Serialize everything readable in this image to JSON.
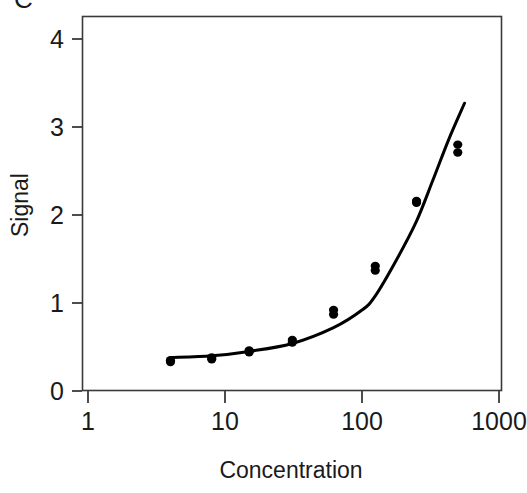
{
  "chart_data": {
    "type": "scatter",
    "title": "",
    "subtitle": "",
    "xlabel": "Concentration",
    "ylabel": "Signal",
    "xscale": "log",
    "yscale": "linear",
    "xlim": [
      1,
      1000
    ],
    "ylim": [
      0,
      4.25
    ],
    "grid": false,
    "legend": null,
    "x_tick_labels": [
      "1",
      "10",
      "100",
      "1000"
    ],
    "x_tick_values": [
      1,
      10,
      100,
      1000
    ],
    "y_tick_labels": [
      "0",
      "1",
      "2",
      "3",
      "4"
    ],
    "y_tick_values": [
      0,
      1,
      2,
      3,
      4
    ],
    "series": [
      {
        "name": "observed",
        "type": "scatter",
        "marker": "filled-circle",
        "color": "#000000",
        "points": [
          {
            "x": 4,
            "y": 0.35
          },
          {
            "x": 4,
            "y": 0.33
          },
          {
            "x": 8,
            "y": 0.38
          },
          {
            "x": 8,
            "y": 0.36
          },
          {
            "x": 15,
            "y": 0.46
          },
          {
            "x": 15,
            "y": 0.44
          },
          {
            "x": 31,
            "y": 0.58
          },
          {
            "x": 31,
            "y": 0.55
          },
          {
            "x": 62,
            "y": 0.92
          },
          {
            "x": 62,
            "y": 0.87
          },
          {
            "x": 125,
            "y": 1.42
          },
          {
            "x": 125,
            "y": 1.37
          },
          {
            "x": 250,
            "y": 2.16
          },
          {
            "x": 250,
            "y": 2.14
          },
          {
            "x": 500,
            "y": 2.8
          },
          {
            "x": 500,
            "y": 2.71
          }
        ]
      },
      {
        "name": "fitted-curve",
        "type": "line",
        "color": "#000000",
        "points": [
          {
            "x": 4,
            "y": 0.38
          },
          {
            "x": 8,
            "y": 0.4
          },
          {
            "x": 15,
            "y": 0.45
          },
          {
            "x": 31,
            "y": 0.54
          },
          {
            "x": 62,
            "y": 0.72
          },
          {
            "x": 100,
            "y": 0.92
          },
          {
            "x": 125,
            "y": 1.08
          },
          {
            "x": 180,
            "y": 1.5
          },
          {
            "x": 250,
            "y": 1.93
          },
          {
            "x": 330,
            "y": 2.4
          },
          {
            "x": 430,
            "y": 2.86
          },
          {
            "x": 560,
            "y": 3.27
          }
        ]
      }
    ]
  },
  "axes": {
    "x_label": "Concentration",
    "y_label": "Signal"
  },
  "clipped_caption_fragment": "C"
}
